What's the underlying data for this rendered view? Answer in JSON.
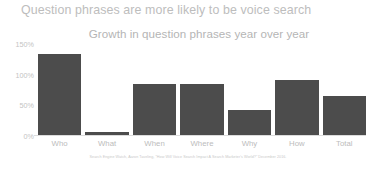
{
  "slide": {
    "title": "Question phrases are more likely to be voice search",
    "source_note": "Search Engine Watch, Aaron Taveling, \"How Will Voice Search Impact A Search Marketer's World?\" December 2016."
  },
  "colors": {
    "bar": "#4c4c4c",
    "title_text": "#bdbdbd",
    "subtitle_text": "#b5b5b5",
    "tick_text": "#c3c3c3",
    "axis_line": "#dcdcdc",
    "background": "#ffffff"
  },
  "chart_data": {
    "type": "bar",
    "title": "Growth in question phrases year over year",
    "xlabel": "",
    "ylabel": "",
    "categories": [
      "Who",
      "What",
      "When",
      "Where",
      "Why",
      "How",
      "Total"
    ],
    "values": [
      134,
      5,
      84,
      84,
      42,
      90,
      65
    ],
    "value_suffix": "%",
    "ylim": [
      0,
      150
    ],
    "yticks": [
      0,
      50,
      100,
      150
    ],
    "ytick_labels": [
      "0%",
      "50%",
      "100%",
      "150%"
    ],
    "grid": false,
    "legend": null
  }
}
